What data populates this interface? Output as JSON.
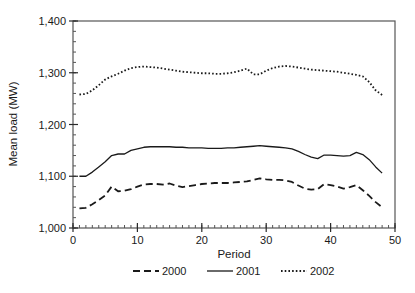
{
  "chart_data": {
    "type": "line",
    "title": "",
    "xlabel": "Period",
    "ylabel": "Mean load (MW)",
    "xlim": [
      0,
      50
    ],
    "ylim": [
      1000,
      1400
    ],
    "xticks": [
      0,
      10,
      20,
      30,
      40,
      50
    ],
    "xtick_labels": [
      "0",
      "10",
      "20",
      "30",
      "40",
      "50"
    ],
    "yticks": [
      1000,
      1100,
      1200,
      1300,
      1400
    ],
    "ytick_labels": [
      "1,000",
      "1,100",
      "1,200",
      "1,300",
      "1,400"
    ],
    "x_minor_step": 1,
    "y_minor_step": 20,
    "grid": false,
    "legend_position": "bottom",
    "x": [
      1,
      2,
      3,
      4,
      5,
      6,
      7,
      8,
      9,
      10,
      11,
      12,
      13,
      14,
      15,
      16,
      17,
      18,
      19,
      20,
      21,
      22,
      23,
      24,
      25,
      26,
      27,
      28,
      29,
      30,
      31,
      32,
      33,
      34,
      35,
      36,
      37,
      38,
      39,
      40,
      41,
      42,
      43,
      44,
      45,
      46,
      47,
      48
    ],
    "series": [
      {
        "name": "2000",
        "style": "dashed",
        "color": "#1a1a1a",
        "values": [
          1038,
          1039,
          1046,
          1054,
          1063,
          1080,
          1071,
          1072,
          1075,
          1080,
          1084,
          1085,
          1085,
          1084,
          1086,
          1082,
          1079,
          1081,
          1083,
          1085,
          1086,
          1087,
          1087,
          1087,
          1088,
          1089,
          1090,
          1093,
          1096,
          1094,
          1093,
          1093,
          1092,
          1089,
          1082,
          1076,
          1074,
          1075,
          1085,
          1083,
          1080,
          1076,
          1079,
          1083,
          1073,
          1062,
          1050,
          1040
        ]
      },
      {
        "name": "2001",
        "style": "solid",
        "color": "#1a1a1a",
        "values": [
          1100,
          1100,
          1108,
          1118,
          1128,
          1140,
          1143,
          1143,
          1150,
          1153,
          1156,
          1157,
          1157,
          1157,
          1157,
          1156,
          1156,
          1155,
          1155,
          1155,
          1154,
          1154,
          1154,
          1155,
          1155,
          1156,
          1157,
          1158,
          1159,
          1158,
          1157,
          1156,
          1155,
          1153,
          1148,
          1142,
          1137,
          1134,
          1141,
          1141,
          1140,
          1139,
          1140,
          1146,
          1142,
          1132,
          1118,
          1106
        ]
      },
      {
        "name": "2002",
        "style": "dotted",
        "color": "#1a1a1a",
        "values": [
          1258,
          1259,
          1266,
          1276,
          1287,
          1293,
          1298,
          1304,
          1309,
          1311,
          1312,
          1311,
          1310,
          1308,
          1306,
          1304,
          1302,
          1301,
          1300,
          1299,
          1299,
          1298,
          1298,
          1299,
          1301,
          1304,
          1308,
          1297,
          1297,
          1304,
          1309,
          1312,
          1313,
          1312,
          1310,
          1308,
          1306,
          1305,
          1304,
          1303,
          1302,
          1300,
          1298,
          1296,
          1293,
          1282,
          1266,
          1257
        ]
      }
    ],
    "legend": [
      {
        "label": "2000",
        "style": "dashed"
      },
      {
        "label": "2001",
        "style": "solid"
      },
      {
        "label": "2002",
        "style": "dotted"
      }
    ]
  }
}
